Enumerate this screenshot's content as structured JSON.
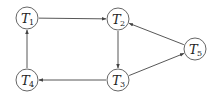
{
  "diagram": {
    "type": "directed-graph",
    "nodes": [
      {
        "id": "T1",
        "base": "T",
        "sub": "1",
        "x": 27,
        "y": 18
      },
      {
        "id": "T2",
        "base": "T",
        "sub": "2",
        "x": 118,
        "y": 19
      },
      {
        "id": "T3",
        "base": "T",
        "sub": "3",
        "x": 118,
        "y": 80
      },
      {
        "id": "T4",
        "base": "T",
        "sub": "4",
        "x": 27,
        "y": 80
      },
      {
        "id": "T5",
        "base": "T",
        "sub": "5",
        "x": 195,
        "y": 49
      }
    ],
    "edges": [
      {
        "from": "T1",
        "to": "T2"
      },
      {
        "from": "T2",
        "to": "T3"
      },
      {
        "from": "T3",
        "to": "T4"
      },
      {
        "from": "T4",
        "to": "T1"
      },
      {
        "from": "T3",
        "to": "T5"
      },
      {
        "from": "T5",
        "to": "T2"
      }
    ],
    "node_radius": 11,
    "colors": {
      "stroke": "#555555",
      "edge": "#444444",
      "text": "#222222"
    }
  }
}
